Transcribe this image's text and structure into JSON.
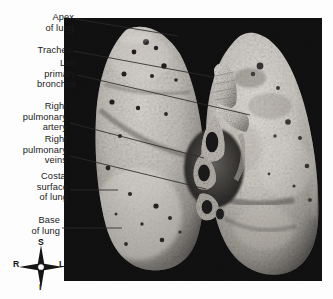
{
  "figure": {
    "background_color": "#fdfdfd",
    "plate_color": "#000000",
    "label_color": "#1b1b1b",
    "leader_color": "#2a2a2a"
  },
  "labels": [
    {
      "id": "apex-of-lung",
      "text": "Apex\nof lung"
    },
    {
      "id": "trachea",
      "text": "Trachea"
    },
    {
      "id": "left-primary-bronchus",
      "text": "Left\nprimary\nbronchus"
    },
    {
      "id": "right-pulmonary-artery",
      "text": "Right\npulmonary\nartery"
    },
    {
      "id": "right-pulmonary-veins",
      "text": "Right\npulmonary\nveins"
    },
    {
      "id": "costal-surface-of-lung",
      "text": "Costal\nsurface\nof lung"
    },
    {
      "id": "base-of-lung",
      "text": "Base\nof lung"
    }
  ],
  "compass": {
    "name": "orientation-compass-rose",
    "superior": "S",
    "inferior": "I",
    "right": "R",
    "left": "L"
  }
}
